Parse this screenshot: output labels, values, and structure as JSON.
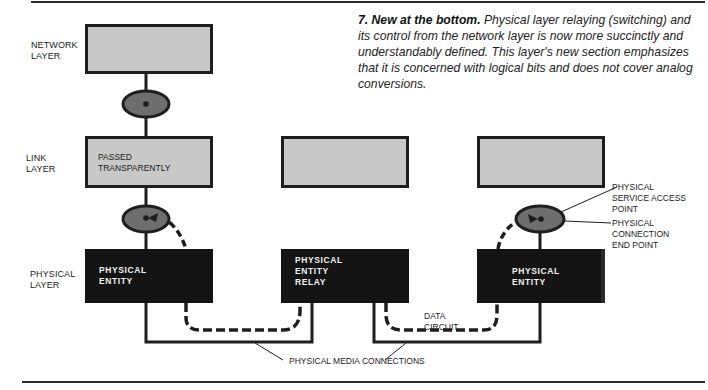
{
  "caption": {
    "number_title": "7. New at the bottom.",
    "body": "Physical layer relaying (switching) and its control from the network layer is now more succinctly and understandably defined. This layer's new section emphasizes that it is concerned with logical bits and does not cover analog conversions."
  },
  "layers": [
    {
      "id": "network",
      "label_line1": "NETWORK",
      "label_line2": "LAYER"
    },
    {
      "id": "link",
      "label_line1": "LINK",
      "label_line2": "LAYER"
    },
    {
      "id": "physical",
      "label_line1": "PHYSICAL",
      "label_line2": "LAYER"
    }
  ],
  "boxes": {
    "network": {
      "text": ""
    },
    "link_left": {
      "text_line1": "PASSED",
      "text_line2": "TRANSPARENTLY"
    },
    "link_middle": {
      "text": ""
    },
    "link_right": {
      "text": ""
    },
    "physical_left": {
      "text_line1": "PHYSICAL",
      "text_line2": "ENTITY"
    },
    "physical_middle": {
      "text_line1": "PHYSICAL",
      "text_line2": "ENTITY",
      "text_line3": "RELAY"
    },
    "physical_right": {
      "text_line1": "PHYSICAL",
      "text_line2": "ENTITY"
    }
  },
  "annotations": {
    "sap_line1": "PHYSICAL",
    "sap_line2": "SERVICE ACCESS",
    "sap_line3": "POINT",
    "cep_line1": "PHYSICAL",
    "cep_line2": "CONNECTION",
    "cep_line3": "END POINT",
    "data_circuit_line1": "DATA",
    "data_circuit_line2": "CIRCUIT",
    "media_connections": "PHYSICAL MEDIA CONNECTIONS"
  },
  "colors": {
    "gray_box": "#c8c8c8",
    "black_box": "#141414",
    "ellipse_fill": "#6e6e6e",
    "line": "#1e1e1e"
  }
}
